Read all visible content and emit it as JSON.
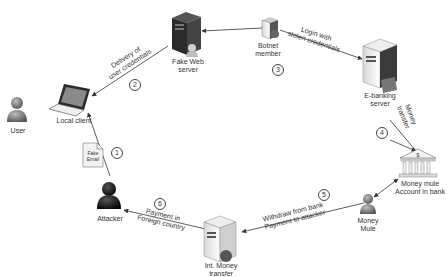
{
  "nodes": {
    "user": {
      "label": "User"
    },
    "local_client": {
      "label": "Local client"
    },
    "fake_email": {
      "label_line1": "Fake",
      "label_line2": "Email"
    },
    "attacker": {
      "label": "Attacker"
    },
    "fake_web_server": {
      "label_line1": "Fake Web",
      "label_line2": "server"
    },
    "botnet_member": {
      "label_line1": "Botnet",
      "label_line2": "member"
    },
    "ebanking_server": {
      "label_line1": "E-banking",
      "label_line2": "server"
    },
    "money_mule_account": {
      "label_line1": "Money mule",
      "label_line2": "Account in bank"
    },
    "money_mule": {
      "label_line1": "Money",
      "label_line2": "Mule"
    },
    "int_money_transfer": {
      "label_line1": "Int. Money",
      "label_line2": "transfer"
    }
  },
  "edges": {
    "e1": {
      "step": "1"
    },
    "e2": {
      "step": "2",
      "label_line1": "Delivery of",
      "label_line2": "user credentials"
    },
    "e3": {
      "step": "3",
      "label_line1": "Login with",
      "label_line2": "stolen credentials"
    },
    "e4": {
      "step": "4",
      "label_line1": "Money",
      "label_line2": "transfer"
    },
    "e5": {
      "step": "5",
      "label_line1": "Withdraw from bank",
      "label_line2": "Payment to attacker"
    },
    "e6": {
      "step": "6",
      "label_line1": "Payment in",
      "label_line2": "Foreign country"
    }
  },
  "colors": {
    "line": "#333333",
    "server_dark": "#2b2b2b",
    "server_light": "#e8e8e8",
    "person_gray": "#7a7a7a",
    "attacker_dark": "#1a1a1a"
  }
}
